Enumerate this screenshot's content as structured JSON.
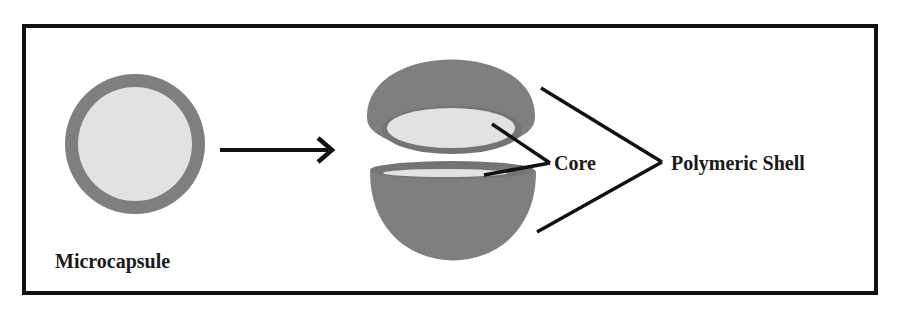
{
  "diagram": {
    "labels": {
      "microcapsule": "Microcapsule",
      "core": "Core",
      "shell": "Polymeric Shell"
    },
    "colors": {
      "frame": "#111111",
      "shell": "#7f7f7f",
      "shell_dark": "#707070",
      "core": "#e2e2e2",
      "line": "#111111",
      "background": "#ffffff"
    }
  }
}
